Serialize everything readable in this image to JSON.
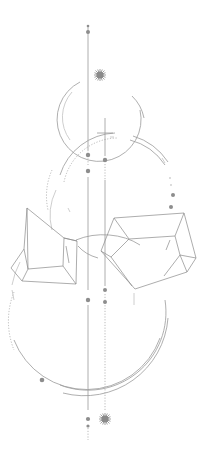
{
  "artwork": {
    "title": "Geometric crystals line illustration",
    "canvas": {
      "width": 212,
      "height": 452,
      "background": "#ffffff"
    },
    "colors": {
      "line": "#9a9a9a",
      "line_light": "#c2c2c2",
      "dot": "#8d8d8d",
      "crystal": "#8a8a8a"
    },
    "elements": {
      "main_axis": {
        "x": 88,
        "y1": 25,
        "y2": 440
      },
      "secondary_axis": {
        "x": 105,
        "y1": 118,
        "y2": 410
      },
      "top_sparkle": {
        "cx": 100,
        "cy": 75
      },
      "bottom_sparkle": {
        "cx": 105,
        "cy": 419
      },
      "top_circle": {
        "cx": 102,
        "cy": 118,
        "r": 42
      },
      "middle_arc": {
        "cx": 110,
        "cy": 205,
        "r": 60
      },
      "bottom_circle": {
        "cx": 90,
        "cy": 300,
        "r": 78
      },
      "left_crystal_label": "left crystal",
      "right_crystal_label": "right crystal"
    }
  }
}
